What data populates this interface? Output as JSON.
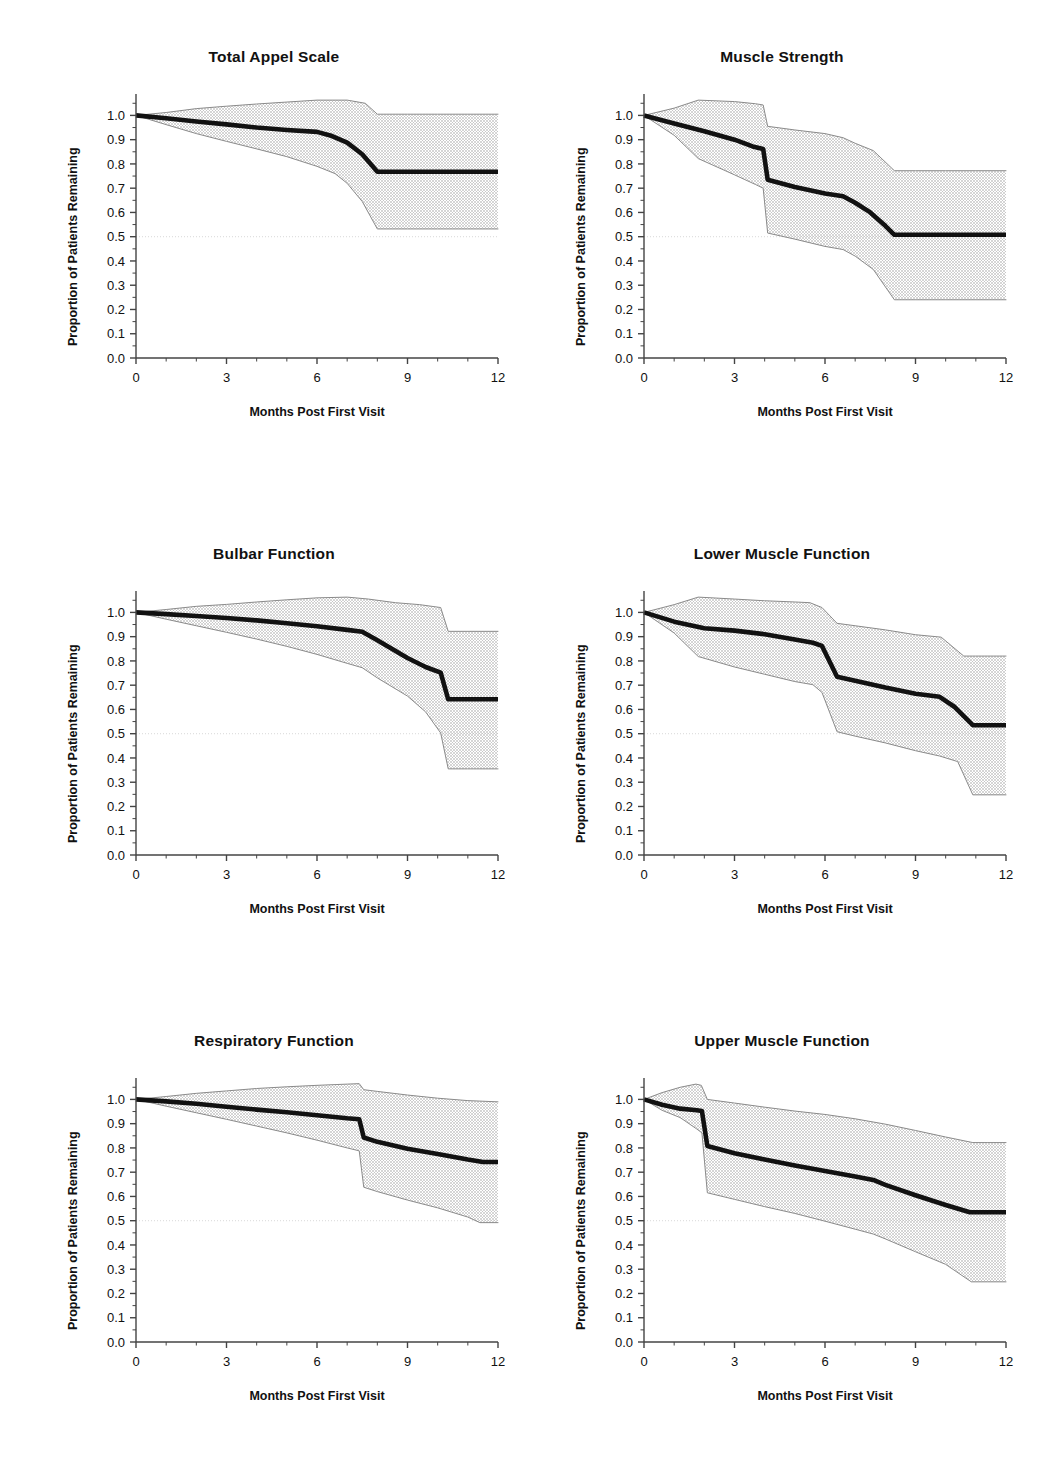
{
  "figure": {
    "panel_layout": "2 columns x 3 rows",
    "shared_axis": {
      "xlabel": "Months Post First Visit",
      "ylabel": "Proportion of Patients Remaining",
      "xticks": [
        "0",
        "3",
        "6",
        "9",
        "12"
      ],
      "xtick_values": [
        0,
        3,
        6,
        9,
        12
      ],
      "xminor_step": 1,
      "yticks": [
        "0.0",
        "0.1",
        "0.2",
        "0.3",
        "0.4",
        "0.5",
        "0.6",
        "0.7",
        "0.8",
        "0.9",
        "1.0"
      ],
      "ytick_values": [
        0.0,
        0.1,
        0.2,
        0.3,
        0.4,
        0.5,
        0.6,
        0.7,
        0.8,
        0.9,
        1.0
      ],
      "xlim": [
        0,
        12
      ],
      "ylim": [
        0.0,
        1.08
      ],
      "reference_line_y": 0.5
    },
    "colors": {
      "curve": "#111111",
      "band_fill": "#d6d6d6",
      "band_edge": "#8a8a8a",
      "axis": "#444444",
      "reference_line": "#d9d9d9",
      "background": "#ffffff",
      "text": "#111111"
    }
  },
  "chart_data": [
    {
      "type": "line",
      "id": "total-appel-scale",
      "title": "Total Appel Scale",
      "xlabel": "Months Post First Visit",
      "ylabel": "Proportion of Patients Remaining",
      "xlim": [
        0,
        12
      ],
      "ylim": [
        0.0,
        1.08
      ],
      "grid": false,
      "reference_line_y": 0.5,
      "series": [
        {
          "name": "Median survival estimate",
          "x": [
            0,
            1,
            2,
            3,
            4,
            5,
            6,
            6.5,
            7,
            7.5,
            8,
            9,
            10,
            11,
            12
          ],
          "values": [
            1.0,
            0.988,
            0.975,
            0.963,
            0.95,
            0.94,
            0.932,
            0.915,
            0.888,
            0.84,
            0.768,
            0.768,
            0.768,
            0.768,
            0.768
          ]
        },
        {
          "name": "Upper 95% confidence limit",
          "x": [
            0,
            1,
            2,
            3,
            4,
            5,
            6,
            7,
            7.6,
            8,
            9,
            10,
            11,
            12
          ],
          "values": [
            1.0,
            1.012,
            1.028,
            1.038,
            1.047,
            1.055,
            1.063,
            1.063,
            1.05,
            1.005,
            1.005,
            1.005,
            1.005,
            1.005
          ]
        },
        {
          "name": "Lower 95% confidence limit",
          "x": [
            0,
            1,
            2,
            3,
            4,
            5,
            6,
            6.6,
            7,
            7.5,
            8,
            9,
            10,
            11,
            12
          ],
          "values": [
            1.0,
            0.962,
            0.925,
            0.893,
            0.862,
            0.83,
            0.79,
            0.76,
            0.72,
            0.645,
            0.532,
            0.532,
            0.532,
            0.532,
            0.532
          ]
        }
      ]
    },
    {
      "type": "line",
      "id": "muscle-strength",
      "title": "Muscle Strength",
      "xlabel": "Months Post First Visit",
      "ylabel": "Proportion of Patients Remaining",
      "xlim": [
        0,
        12
      ],
      "ylim": [
        0.0,
        1.08
      ],
      "grid": false,
      "reference_line_y": 0.5,
      "series": [
        {
          "name": "Median survival estimate",
          "x": [
            0,
            1,
            2,
            3,
            3.6,
            3.95,
            4.1,
            5,
            6,
            6.6,
            7,
            7.5,
            8,
            8.3,
            9,
            10,
            11,
            12
          ],
          "values": [
            1.0,
            0.967,
            0.935,
            0.9,
            0.872,
            0.862,
            0.735,
            0.705,
            0.678,
            0.667,
            0.64,
            0.6,
            0.545,
            0.508,
            0.508,
            0.508,
            0.508,
            0.508
          ]
        },
        {
          "name": "Upper 95% confidence limit",
          "x": [
            0,
            1,
            1.8,
            3,
            3.7,
            3.95,
            4.1,
            5,
            6,
            6.6,
            7,
            7.6,
            8.3,
            9,
            10,
            11,
            12
          ],
          "values": [
            1.0,
            1.03,
            1.063,
            1.057,
            1.048,
            1.043,
            0.955,
            0.94,
            0.925,
            0.908,
            0.885,
            0.855,
            0.772,
            0.772,
            0.772,
            0.772,
            0.772
          ]
        },
        {
          "name": "Lower 95% confidence limit",
          "x": [
            0,
            1,
            1.8,
            3,
            3.7,
            3.95,
            4.1,
            5,
            6,
            6.6,
            7,
            7.6,
            8.3,
            9,
            10,
            11,
            12
          ],
          "values": [
            1.0,
            0.918,
            0.822,
            0.755,
            0.715,
            0.7,
            0.515,
            0.49,
            0.46,
            0.447,
            0.42,
            0.365,
            0.24,
            0.24,
            0.24,
            0.24,
            0.24
          ]
        }
      ]
    },
    {
      "type": "line",
      "id": "bulbar-function",
      "title": "Bulbar Function",
      "xlabel": "Months Post First Visit",
      "ylabel": "Proportion of Patients Remaining",
      "xlim": [
        0,
        12
      ],
      "ylim": [
        0.0,
        1.08
      ],
      "grid": false,
      "reference_line_y": 0.5,
      "series": [
        {
          "name": "Median survival estimate",
          "x": [
            0,
            1,
            2,
            3,
            4,
            5,
            6,
            7,
            7.5,
            8,
            9,
            9.6,
            10.1,
            10.35,
            11,
            12
          ],
          "values": [
            1.0,
            0.993,
            0.985,
            0.977,
            0.967,
            0.955,
            0.943,
            0.928,
            0.92,
            0.885,
            0.812,
            0.775,
            0.752,
            0.642,
            0.642,
            0.642
          ]
        },
        {
          "name": "Upper 95% confidence limit",
          "x": [
            0,
            1,
            2,
            3,
            4,
            5,
            6,
            7,
            7.7,
            8.6,
            9.4,
            10.1,
            10.35,
            11,
            12
          ],
          "values": [
            1.0,
            1.012,
            1.025,
            1.033,
            1.043,
            1.052,
            1.06,
            1.063,
            1.055,
            1.04,
            1.032,
            1.02,
            0.922,
            0.922,
            0.922
          ]
        },
        {
          "name": "Lower 95% confidence limit",
          "x": [
            0,
            1,
            2,
            3,
            4,
            5,
            6,
            7,
            7.5,
            8,
            9,
            9.6,
            10.1,
            10.35,
            11,
            12
          ],
          "values": [
            1.0,
            0.972,
            0.945,
            0.918,
            0.89,
            0.86,
            0.827,
            0.79,
            0.772,
            0.73,
            0.655,
            0.59,
            0.503,
            0.355,
            0.355,
            0.355
          ]
        }
      ]
    },
    {
      "type": "line",
      "id": "lower-muscle-function",
      "title": "Lower Muscle Function",
      "xlabel": "Months Post First Visit",
      "ylabel": "Proportion of Patients Remaining",
      "xlim": [
        0,
        12
      ],
      "ylim": [
        0.0,
        1.08
      ],
      "grid": false,
      "reference_line_y": 0.5,
      "series": [
        {
          "name": "Median survival estimate",
          "x": [
            0,
            1,
            2,
            3,
            4,
            5,
            5.6,
            5.9,
            6.4,
            7,
            8,
            9,
            9.8,
            10.3,
            10.9,
            11.4,
            12
          ],
          "values": [
            1.0,
            0.962,
            0.935,
            0.925,
            0.91,
            0.888,
            0.875,
            0.862,
            0.735,
            0.718,
            0.69,
            0.665,
            0.652,
            0.61,
            0.535,
            0.535,
            0.535
          ]
        },
        {
          "name": "Upper 95% confidence limit",
          "x": [
            0,
            1,
            1.8,
            3,
            4,
            5,
            5.5,
            5.9,
            6.4,
            7,
            8,
            9,
            9.85,
            10.6,
            11,
            12
          ],
          "values": [
            1.0,
            1.032,
            1.063,
            1.055,
            1.048,
            1.043,
            1.04,
            1.02,
            0.955,
            0.945,
            0.928,
            0.908,
            0.898,
            0.82,
            0.82,
            0.82
          ]
        },
        {
          "name": "Lower 95% confidence limit",
          "x": [
            0,
            1,
            1.8,
            3,
            4,
            5,
            5.6,
            5.9,
            6.4,
            7,
            8,
            9,
            9.8,
            10.4,
            10.9,
            11.4,
            12
          ],
          "values": [
            1.0,
            0.915,
            0.818,
            0.775,
            0.745,
            0.715,
            0.702,
            0.67,
            0.508,
            0.49,
            0.462,
            0.43,
            0.408,
            0.385,
            0.248,
            0.248,
            0.248
          ]
        }
      ]
    },
    {
      "type": "line",
      "id": "respiratory-function",
      "title": "Respiratory Function",
      "xlabel": "Months Post First Visit",
      "ylabel": "Proportion of Patients Remaining",
      "xlim": [
        0,
        12
      ],
      "ylim": [
        0.0,
        1.08
      ],
      "grid": false,
      "reference_line_y": 0.5,
      "series": [
        {
          "name": "Median survival estimate",
          "x": [
            0,
            1,
            2,
            3,
            4,
            5,
            6,
            7,
            7.4,
            7.55,
            8,
            9,
            10,
            11,
            11.5,
            12
          ],
          "values": [
            1.0,
            0.992,
            0.982,
            0.97,
            0.958,
            0.947,
            0.935,
            0.922,
            0.918,
            0.843,
            0.825,
            0.797,
            0.775,
            0.752,
            0.742,
            0.742
          ]
        },
        {
          "name": "Upper 95% confidence limit",
          "x": [
            0,
            1,
            2,
            3,
            4,
            5,
            6,
            7,
            7.4,
            7.55,
            8,
            9,
            10,
            11,
            12
          ],
          "values": [
            1.0,
            1.012,
            1.025,
            1.035,
            1.045,
            1.052,
            1.058,
            1.063,
            1.065,
            1.04,
            1.033,
            1.018,
            1.005,
            0.995,
            0.99
          ]
        },
        {
          "name": "Lower 95% confidence limit",
          "x": [
            0,
            1,
            2,
            3,
            4,
            5,
            6,
            7,
            7.4,
            7.55,
            8,
            9,
            10,
            11,
            11.4,
            12
          ],
          "values": [
            1.0,
            0.972,
            0.945,
            0.918,
            0.89,
            0.862,
            0.832,
            0.8,
            0.788,
            0.638,
            0.62,
            0.585,
            0.553,
            0.515,
            0.492,
            0.492
          ]
        }
      ]
    },
    {
      "type": "line",
      "id": "upper-muscle-function",
      "title": "Upper Muscle Function",
      "xlabel": "Months Post First Visit",
      "ylabel": "Proportion of Patients Remaining",
      "xlim": [
        0,
        12
      ],
      "ylim": [
        0.0,
        1.08
      ],
      "grid": false,
      "reference_line_y": 0.5,
      "series": [
        {
          "name": "Median survival estimate",
          "x": [
            0,
            0.6,
            1.2,
            1.75,
            1.92,
            2.1,
            3,
            4,
            5,
            6,
            7,
            7.6,
            8,
            9,
            10,
            10.8,
            11.4,
            12
          ],
          "values": [
            1.0,
            0.978,
            0.962,
            0.955,
            0.952,
            0.808,
            0.778,
            0.752,
            0.728,
            0.705,
            0.682,
            0.668,
            0.648,
            0.605,
            0.565,
            0.535,
            0.535,
            0.535
          ]
        },
        {
          "name": "Upper 95% confidence limit",
          "x": [
            0,
            0.6,
            1.2,
            1.72,
            1.9,
            2.1,
            3,
            4,
            5,
            6,
            7,
            8,
            9,
            10,
            10.9,
            11.4,
            12
          ],
          "values": [
            1.0,
            1.028,
            1.05,
            1.063,
            1.058,
            1.0,
            0.985,
            0.968,
            0.952,
            0.938,
            0.92,
            0.898,
            0.872,
            0.845,
            0.822,
            0.822,
            0.822
          ]
        },
        {
          "name": "Lower 95% confidence limit",
          "x": [
            0,
            0.6,
            1.2,
            1.75,
            1.92,
            2.1,
            3,
            4,
            5,
            6,
            7,
            7.6,
            8,
            9,
            10,
            10.85,
            11.4,
            12
          ],
          "values": [
            1.0,
            0.955,
            0.925,
            0.878,
            0.862,
            0.615,
            0.588,
            0.558,
            0.53,
            0.498,
            0.465,
            0.445,
            0.425,
            0.372,
            0.32,
            0.248,
            0.248,
            0.248
          ]
        }
      ]
    }
  ]
}
